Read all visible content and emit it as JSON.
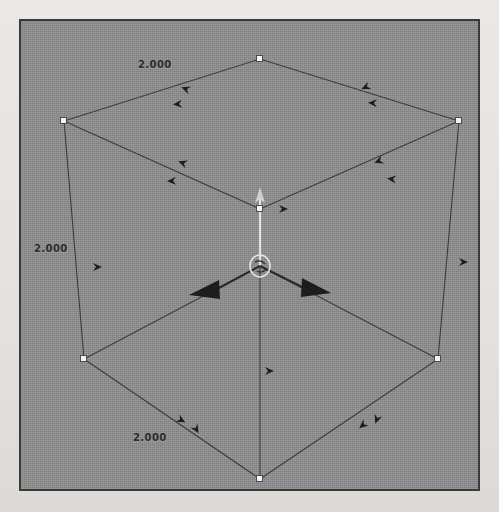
{
  "app": {
    "type": "3d-modeling-viewport",
    "title": "3D Viewport"
  },
  "viewport": {
    "background_color": "#8e8e8e",
    "border_color": "#3a3a3a",
    "page_color": "#e9e8e6",
    "width": 461,
    "height": 472
  },
  "model": {
    "shape": "cube",
    "projection": "isometric",
    "wireframe": true,
    "edge_color": "#3c3c3c",
    "vertex_handle_color": "#f2f2f2",
    "vertex_handle_border": "#4a4a4a",
    "vertices": [
      {
        "name": "top",
        "x": 239,
        "y": 38,
        "handle": true
      },
      {
        "name": "top-left",
        "x": 43,
        "y": 100,
        "handle": true
      },
      {
        "name": "top-right",
        "x": 438,
        "y": 100,
        "handle": true
      },
      {
        "name": "center",
        "x": 239,
        "y": 188,
        "handle": true
      },
      {
        "name": "bottom-left",
        "x": 63,
        "y": 338,
        "handle": true
      },
      {
        "name": "bottom-right",
        "x": 417,
        "y": 338,
        "handle": true
      },
      {
        "name": "bottom",
        "x": 239,
        "y": 458,
        "handle": true
      }
    ]
  },
  "dimensions": [
    {
      "id": "dim-top",
      "value": "2.000",
      "edge": "top-left-upper"
    },
    {
      "id": "dim-left",
      "value": "2.000",
      "edge": "left-vertical"
    },
    {
      "id": "dim-bottom",
      "value": "2.000",
      "edge": "bottom-left-lower"
    }
  ],
  "gizmo": {
    "name": "translate-gizmo",
    "origin": {
      "x": 239,
      "y": 245
    },
    "handle_color": "#1e1e1e",
    "ring_color": "#dcdcdc",
    "axes": [
      {
        "name": "axis-x-negative",
        "direction": "down-left",
        "arrow": true
      },
      {
        "name": "axis-y-positive",
        "direction": "down-right",
        "arrow": true
      },
      {
        "name": "axis-z-positive",
        "direction": "up",
        "arrow": true
      }
    ]
  },
  "edge_markers": [
    {
      "name": "marker-top-left-edge",
      "x": 165,
      "y": 68,
      "rot": 200
    },
    {
      "name": "marker-top-left-edge-2",
      "x": 157,
      "y": 83,
      "rot": 175
    },
    {
      "name": "marker-top-right-edge",
      "x": 345,
      "y": 66,
      "rot": 155
    },
    {
      "name": "marker-top-right-edge-2",
      "x": 352,
      "y": 82,
      "rot": 182
    },
    {
      "name": "marker-inner-left",
      "x": 162,
      "y": 142,
      "rot": 200
    },
    {
      "name": "marker-inner-left-2",
      "x": 151,
      "y": 160,
      "rot": 178
    },
    {
      "name": "marker-inner-right",
      "x": 358,
      "y": 140,
      "rot": 160
    },
    {
      "name": "marker-inner-right-2",
      "x": 371,
      "y": 158,
      "rot": 186
    },
    {
      "name": "marker-bottom-left-edge",
      "x": 160,
      "y": 399,
      "rot": 30
    },
    {
      "name": "marker-bottom-left-edge-2",
      "x": 175,
      "y": 408,
      "rot": 60
    },
    {
      "name": "marker-bottom-right-edge",
      "x": 342,
      "y": 404,
      "rot": 140
    },
    {
      "name": "marker-bottom-right-edge-2",
      "x": 356,
      "y": 398,
      "rot": 110
    },
    {
      "name": "marker-left-vertical",
      "x": 76,
      "y": 246,
      "rot": 0
    },
    {
      "name": "marker-right-vertical",
      "x": 442,
      "y": 241,
      "rot": 0
    },
    {
      "name": "marker-bottom-center",
      "x": 248,
      "y": 350,
      "rot": 0
    },
    {
      "name": "marker-top-center",
      "x": 262,
      "y": 188,
      "rot": 0
    }
  ]
}
